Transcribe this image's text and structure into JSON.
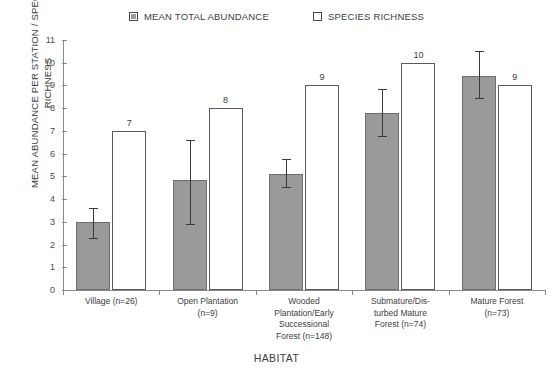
{
  "chart_data": {
    "type": "bar",
    "title": "",
    "xlabel": "HABITAT",
    "ylabel": "MEAN ABUNDANCE PER STATION / SPECIES RICHNESS",
    "ylim": [
      0,
      11
    ],
    "ytick_step": 1,
    "yticks": [
      "0",
      "1",
      "2",
      "3",
      "4",
      "5",
      "6",
      "7",
      "8",
      "9",
      "10",
      "11"
    ],
    "grid": false,
    "legend_position": "top-center",
    "categories": [
      "Village (n=26)",
      "Open Plantation\n(n=9)",
      "Wooded\nPlantation/Early\nSuccessional\nForest (n=148)",
      "Submature/Dis-\nturbed Mature\nForest (n=74)",
      "Mature Forest\n(n=73)"
    ],
    "series": [
      {
        "name": "MEAN TOTAL ABUNDANCE",
        "style": "filled-gray",
        "color": "#9a9a9a",
        "border": "#6f6f6f",
        "values": [
          3.0,
          4.85,
          5.1,
          7.8,
          9.4
        ],
        "errors_low": [
          2.25,
          2.85,
          4.5,
          6.75,
          8.4
        ],
        "errors_high": [
          3.6,
          6.6,
          5.75,
          8.85,
          10.5
        ],
        "labels": [
          "",
          "",
          "",
          "",
          ""
        ]
      },
      {
        "name": "SPECIES RICHNESS",
        "style": "hollow-white",
        "color": "#ffffff",
        "border": "#5a5a5a",
        "values": [
          7,
          8,
          9,
          10,
          9
        ],
        "labels": [
          "7",
          "8",
          "9",
          "10",
          "9"
        ]
      }
    ]
  },
  "legend": {
    "items": [
      {
        "label": "MEAN TOTAL ABUNDANCE",
        "swatch": "filled"
      },
      {
        "label": "SPECIES RICHNESS",
        "swatch": "hollow"
      }
    ]
  },
  "axes": {
    "y_title": "MEAN ABUNDANCE PER STATION / SPECIES RICHNESS",
    "x_title": "HABITAT"
  }
}
